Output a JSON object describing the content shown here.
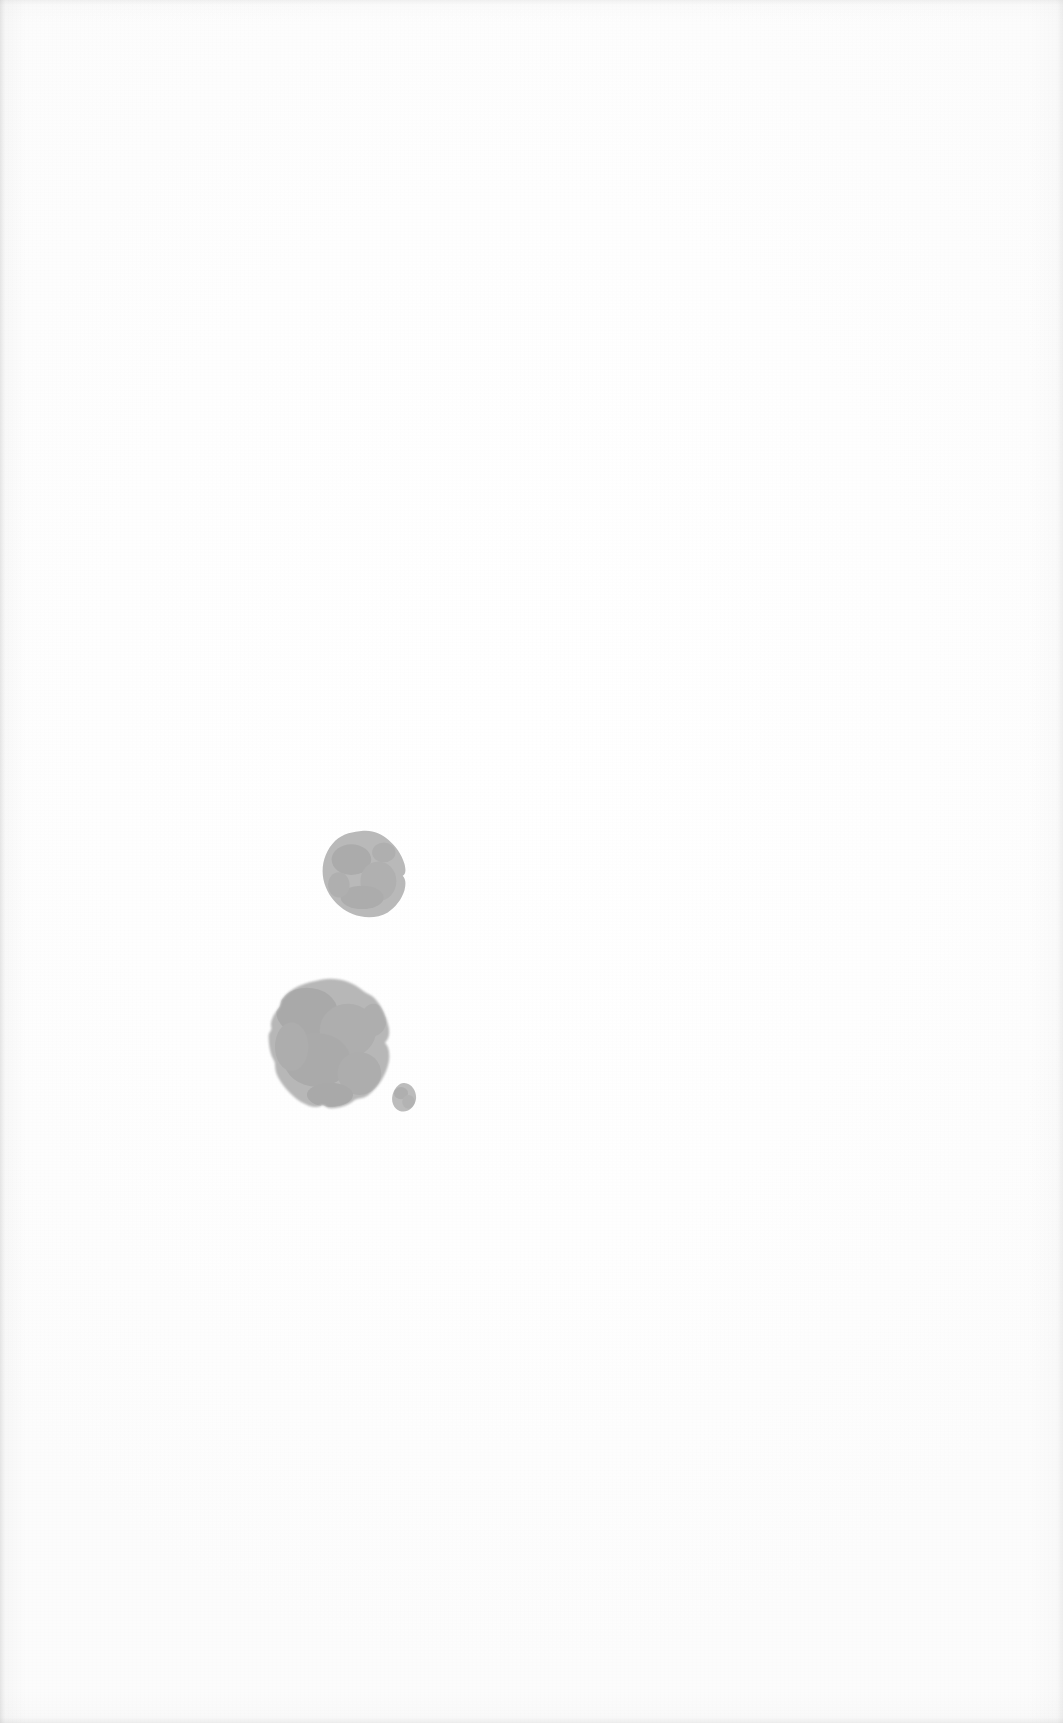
{
  "document": {
    "kind": "scanned-page",
    "page_label": "",
    "width": 1063,
    "height": 1723,
    "background_color": "#fdfdfd",
    "text_content": "",
    "note": "Blank scanned page — no printed text, headings, page numbers or rules are visible."
  },
  "palette": {
    "paper": "#fdfdfd",
    "paper_edge": "#e9e9e9",
    "ink_blob": "#b8b8b8",
    "ink_blob_dark": "#ababab",
    "ink_blob_light": "#c4c4c4"
  },
  "marks": [
    {
      "id": "stain-upper",
      "name": "ink-stain-upper",
      "shape": "irregular-round",
      "color": "#b9b9b9",
      "left": 319,
      "top": 829,
      "width": 90,
      "height": 90,
      "center_x": 364,
      "center_y": 874,
      "radius": 44
    },
    {
      "id": "stain-large",
      "name": "ink-stain-large",
      "shape": "irregular-round-notched",
      "color": "#b7b7b7",
      "left": 266,
      "top": 977,
      "width": 128,
      "height": 134,
      "center_x": 330,
      "center_y": 1044,
      "radius": 63
    },
    {
      "id": "stain-dot",
      "name": "ink-stain-dot",
      "shape": "small-round",
      "color": "#bcbcbc",
      "left": 390,
      "top": 1082,
      "width": 29,
      "height": 31,
      "center_x": 404,
      "center_y": 1097,
      "radius": 15
    }
  ]
}
